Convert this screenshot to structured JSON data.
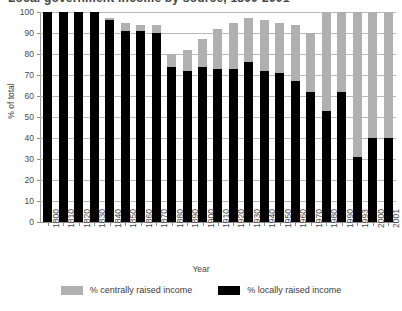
{
  "title": {
    "text": "Local government income by source, 1800-2001",
    "clipped": true
  },
  "axes": {
    "ylabel": "% of total",
    "xlabel": "Year",
    "yticks": [
      "0",
      "10",
      "20",
      "30",
      "40",
      "50",
      "60",
      "70",
      "80",
      "90",
      "100"
    ]
  },
  "legend": {
    "items": [
      {
        "label": "% centrally raised income",
        "color": "#b0b0b0",
        "key": "central"
      },
      {
        "label": "% locally raised income",
        "color": "#000000",
        "key": "local"
      }
    ]
  },
  "colors": {
    "central": "#b0b0b0",
    "local": "#000000",
    "grid": "#b9b9b9",
    "axis": "#8d8d8d",
    "text": "#4a4a4a",
    "background": "#ffffff"
  },
  "chart_data": {
    "type": "bar",
    "subtype": "stacked",
    "title": "Local government income by source, 1800-2001",
    "xlabel": "Year",
    "ylabel": "% of total",
    "ylim": [
      0,
      100
    ],
    "ytick_step": 10,
    "grid": true,
    "legend_position": "bottom",
    "categories": [
      "1800",
      "1810",
      "1820",
      "1830",
      "1840",
      "1850",
      "1860",
      "1870",
      "1880",
      "1890",
      "1900",
      "1910",
      "1920",
      "1930",
      "1940",
      "1950",
      "1960",
      "1970",
      "1980",
      "1990",
      "1993",
      "2000",
      "2001"
    ],
    "series": [
      {
        "name": "% locally raised income",
        "color": "#000000",
        "values": [
          100,
          100,
          100,
          100,
          96,
          91,
          91,
          90,
          74,
          72,
          74,
          73,
          73,
          76,
          72,
          71,
          67,
          62,
          53,
          62,
          31,
          40,
          40
        ]
      },
      {
        "name": "% centrally raised income",
        "color": "#b0b0b0",
        "values": [
          0,
          0,
          0,
          0,
          1,
          4,
          3,
          4,
          6,
          10,
          13,
          19,
          22,
          21,
          24,
          24,
          27,
          28,
          47,
          38,
          69,
          60,
          60
        ]
      }
    ],
    "totals": [
      100,
      100,
      100,
      100,
      97,
      95,
      94,
      94,
      80,
      82,
      87,
      92,
      95,
      97,
      96,
      95,
      94,
      90,
      100,
      100,
      100,
      100,
      100
    ]
  }
}
